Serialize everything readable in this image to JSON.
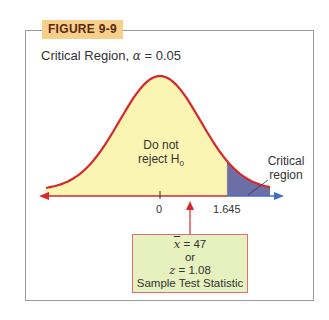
{
  "figure": {
    "label": "FIGURE 9-9",
    "subtitle_prefix": "Critical Region,",
    "alpha_symbol": "α",
    "alpha_eq": "= 0.05"
  },
  "annotations": {
    "accept_line1": "Do not",
    "accept_line2": "reject H",
    "accept_sub": "0",
    "critical_line1": "Critical",
    "critical_line2": "region"
  },
  "stat_box": {
    "xbar_symbol": "x",
    "xbar_value": "= 47",
    "or": "or",
    "z_symbol": "z",
    "z_value": "= 1.08",
    "caption": "Sample Test Statistic"
  },
  "colors": {
    "curve": "#d9262a",
    "fill_accept": "#fbf5b4",
    "fill_critical": "#6b6fa6",
    "axis_left": "#d9262a",
    "axis_right": "#3d6fc4",
    "label_bg": "#f7cf8a",
    "box_bg": "#e7f0bf"
  },
  "chart_data": {
    "type": "area",
    "title": "Critical Region, α = 0.05",
    "distribution": "standard normal",
    "x_ticks": [
      {
        "value": 0,
        "label": "0"
      },
      {
        "value": 1.645,
        "label": "1.645"
      }
    ],
    "regions": [
      {
        "name": "Do not reject H0",
        "range": [
          -3.5,
          1.645
        ]
      },
      {
        "name": "Critical region",
        "range": [
          1.645,
          3.5
        ]
      }
    ],
    "alpha": 0.05,
    "tail": "right",
    "critical_value": 1.645,
    "test_statistic": {
      "xbar": 47,
      "z": 1.08,
      "label": "Sample Test Statistic"
    },
    "xlabel": "",
    "ylabel": "",
    "grid": false
  }
}
